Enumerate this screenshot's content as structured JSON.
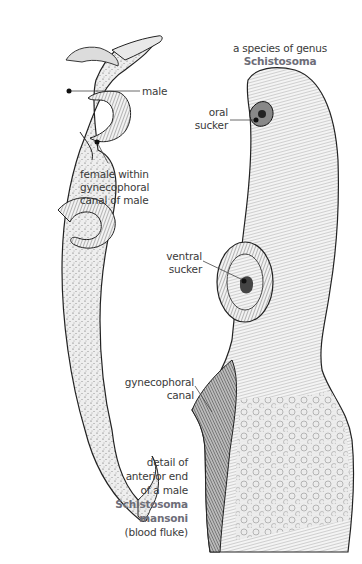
{
  "figure": {
    "left_panel": {
      "subject": "male and female schistosome pair",
      "labels": {
        "male": "male",
        "female_line1": "female within",
        "female_line2": "gynecophoral",
        "female_line3": "canal of male"
      }
    },
    "right_panel": {
      "title_line1": "a species of genus",
      "title_line2": "Schistosoma",
      "labels": {
        "oral_line1": "oral",
        "oral_line2": "sucker",
        "ventral_line1": "ventral",
        "ventral_line2": "sucker",
        "gyne_line1": "gynecophoral",
        "gyne_line2": "canal"
      },
      "caption": {
        "line1": "detail of",
        "line2": "anterior end",
        "line3": "of a male",
        "species_line1": "Schistosoma",
        "species_line2": "mansoni",
        "line6": "(blood fluke)"
      }
    },
    "colors": {
      "text": "#3a3a3a",
      "species_text": "#6d6d78",
      "ink": "#222222",
      "stipple_fill": "#e6e6e6",
      "leader_line": "#444444"
    }
  }
}
